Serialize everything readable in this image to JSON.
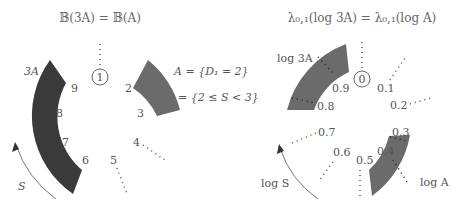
{
  "left": {
    "title": "𝔹(3A) = 𝔹(A)",
    "center_label": "1",
    "ticks": [
      "2",
      "3",
      "4",
      "5",
      "6",
      "7",
      "8",
      "9"
    ],
    "arc_dark_label": "3A",
    "arc_light_label_line1": "A = {D₁ = 2}",
    "arc_light_label_line2": "= {2 ≤ S < 3}",
    "arrow_label": "S",
    "colors": {
      "dark_arc": "#3a3a3a",
      "light_arc": "#6b6b6b"
    }
  },
  "right": {
    "title": "λ₀,₁(log 3A) = λ₀,₁(log A)",
    "center_label": "0",
    "ticks": [
      "0.1",
      "0.2",
      "0.3",
      "0.4",
      "0.5",
      "0.6",
      "0.7",
      "0.8",
      "0.9"
    ],
    "arc_top_label": "log 3A",
    "arc_bottom_label": "log A",
    "arrow_label": "log S",
    "colors": {
      "arc": "#6b6b6b"
    }
  }
}
